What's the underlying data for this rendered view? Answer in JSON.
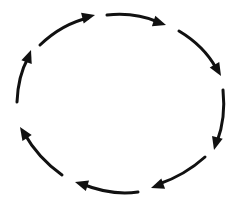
{
  "diagram": {
    "type": "cycle",
    "direction": "clockwise",
    "style": "hand-drawn",
    "stroke_color": "#111111",
    "background": "#ffffff",
    "arrows": [
      {
        "id": "arrow-1",
        "d": "M 40 45 Q 62 24 88 18",
        "head": [
          95,
          15
        ],
        "angle": -14
      },
      {
        "id": "arrow-2",
        "d": "M 107 15 Q 135 12 158 22",
        "head": [
          166,
          25
        ],
        "angle": 18
      },
      {
        "id": "arrow-3",
        "d": "M 179 31 Q 204 46 216 68",
        "head": [
          221,
          76
        ],
        "angle": 60
      },
      {
        "id": "arrow-4",
        "d": "M 223 90 Q 226 118 217 142",
        "head": [
          214,
          150
        ],
        "angle": 105
      },
      {
        "id": "arrow-5",
        "d": "M 205 157 Q 185 175 159 184",
        "head": [
          151,
          188
        ],
        "angle": 160
      },
      {
        "id": "arrow-6",
        "d": "M 138 192 Q 112 196 82 184",
        "head": [
          75,
          182
        ],
        "angle": 197
      },
      {
        "id": "arrow-7",
        "d": "M 62 175 Q 38 158 24 133",
        "head": [
          20,
          127
        ],
        "angle": 237
      },
      {
        "id": "arrow-8",
        "d": "M 17 102 Q 18 76 28 58",
        "head": [
          31,
          50
        ],
        "angle": 290
      }
    ]
  }
}
